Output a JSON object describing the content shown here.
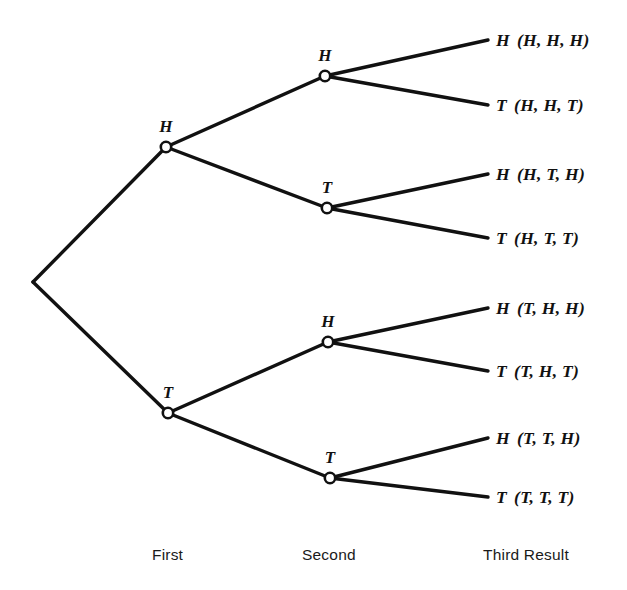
{
  "figure": {
    "type": "probability-tree",
    "background_color": "#ffffff",
    "line_color": "#111111",
    "node_fill_color": "#ffffff"
  },
  "root": {
    "x": 33,
    "y": 282
  },
  "level1": [
    {
      "id": "h1",
      "label": "H",
      "x": 166,
      "y": 147,
      "label_x": 166,
      "label_y": 127
    },
    {
      "id": "t1",
      "label": "T",
      "x": 168,
      "y": 413,
      "label_x": 168,
      "label_y": 393
    }
  ],
  "level2": [
    {
      "id": "h1h2",
      "label": "H",
      "parent": "h1",
      "x": 325,
      "y": 76,
      "label_x": 325,
      "label_y": 56
    },
    {
      "id": "h1t2",
      "label": "T",
      "parent": "h1",
      "x": 327,
      "y": 208,
      "label_x": 327,
      "label_y": 188
    },
    {
      "id": "t1h2",
      "label": "H",
      "parent": "t1",
      "x": 328,
      "y": 342,
      "label_x": 328,
      "label_y": 322
    },
    {
      "id": "t1t2",
      "label": "T",
      "parent": "t1",
      "x": 330,
      "y": 478,
      "label_x": 330,
      "label_y": 458
    }
  ],
  "leaves": [
    {
      "id": "hhh",
      "parent": "h1h2",
      "outcome": "H",
      "tuple": "(H, H, H)",
      "x": 488,
      "y": 40,
      "text_x": 496
    },
    {
      "id": "hht",
      "parent": "h1h2",
      "outcome": "T",
      "tuple": "(H, H, T)",
      "x": 488,
      "y": 105,
      "text_x": 496
    },
    {
      "id": "hth",
      "parent": "h1t2",
      "outcome": "H",
      "tuple": "(H, T, H)",
      "x": 488,
      "y": 174,
      "text_x": 496
    },
    {
      "id": "htt",
      "parent": "h1t2",
      "outcome": "T",
      "tuple": "(H, T, T)",
      "x": 488,
      "y": 238,
      "text_x": 496
    },
    {
      "id": "thh",
      "parent": "t1h2",
      "outcome": "H",
      "tuple": "(T, H, H)",
      "x": 488,
      "y": 308,
      "text_x": 496
    },
    {
      "id": "tht",
      "parent": "t1h2",
      "outcome": "T",
      "tuple": "(T, H, T)",
      "x": 488,
      "y": 371,
      "text_x": 496
    },
    {
      "id": "tth",
      "parent": "t1t2",
      "outcome": "H",
      "tuple": "(T, T, H)",
      "x": 488,
      "y": 438,
      "text_x": 496
    },
    {
      "id": "ttt",
      "parent": "t1t2",
      "outcome": "T",
      "tuple": "(T, T, T)",
      "x": 488,
      "y": 497,
      "text_x": 496
    }
  ],
  "stage_labels": [
    {
      "id": "first",
      "text": "First",
      "x": 152,
      "y": 546
    },
    {
      "id": "second",
      "text": "Second",
      "x": 302,
      "y": 546
    },
    {
      "id": "third",
      "text": "Third Result",
      "x": 483,
      "y": 546
    }
  ],
  "chart_data": {
    "type": "diagram",
    "title": "",
    "stages": [
      "First",
      "Second",
      "Third Result"
    ],
    "outcomes": [
      "(H, H, H)",
      "(H, H, T)",
      "(H, T, H)",
      "(H, T, T)",
      "(T, H, H)",
      "(T, H, T)",
      "(T, T, H)",
      "(T, T, T)"
    ],
    "branch_symbols": [
      "H",
      "T"
    ],
    "total_outcomes": 8
  }
}
